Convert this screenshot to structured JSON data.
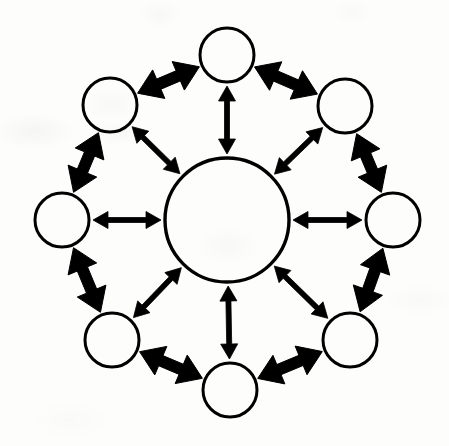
{
  "figure": {
    "kind": "network-diagram",
    "background_color": "#fdfdfc",
    "ink_color": "#000000",
    "canvas": {
      "width": 449,
      "height": 446
    }
  },
  "hub": {
    "label": "",
    "cx": 227,
    "cy": 220,
    "r": 62,
    "stroke_width": 3.4
  },
  "node_defaults": {
    "r": 27,
    "stroke_width": 3.0
  },
  "nodes": [
    {
      "id": "node-n",
      "name": "top-node",
      "label": "",
      "cx": 227,
      "cy": 55,
      "r": 27
    },
    {
      "id": "node-ne",
      "name": "upper-right-node",
      "label": "",
      "cx": 345,
      "cy": 106,
      "r": 27
    },
    {
      "id": "node-e",
      "name": "right-node",
      "label": "",
      "cx": 393,
      "cy": 220,
      "r": 27
    },
    {
      "id": "node-se",
      "name": "lower-right-node",
      "label": "",
      "cx": 350,
      "cy": 340,
      "r": 27
    },
    {
      "id": "node-s",
      "name": "bottom-node",
      "label": "",
      "cx": 230,
      "cy": 390,
      "r": 27
    },
    {
      "id": "node-sw",
      "name": "lower-left-node",
      "label": "",
      "cx": 112,
      "cy": 340,
      "r": 27
    },
    {
      "id": "node-w",
      "name": "left-node",
      "label": "",
      "cx": 62,
      "cy": 220,
      "r": 27
    },
    {
      "id": "node-nw",
      "name": "upper-left-node",
      "label": "",
      "cx": 110,
      "cy": 105,
      "r": 27
    }
  ],
  "spokes": {
    "style": "double-headed-arrow",
    "shaft_width": 5,
    "head_length": 15,
    "head_width": 17,
    "gap_hub": 4,
    "gap_node": 4,
    "edges": [
      {
        "id": "spoke-hub-n",
        "name": "spoke-hub-to-top-node",
        "from": "hub",
        "to": "node-n"
      },
      {
        "id": "spoke-hub-ne",
        "name": "spoke-hub-to-upper-right-node",
        "from": "hub",
        "to": "node-ne"
      },
      {
        "id": "spoke-hub-e",
        "name": "spoke-hub-to-right-node",
        "from": "hub",
        "to": "node-e"
      },
      {
        "id": "spoke-hub-se",
        "name": "spoke-hub-to-lower-right-node",
        "from": "hub",
        "to": "node-se"
      },
      {
        "id": "spoke-hub-s",
        "name": "spoke-hub-to-bottom-node",
        "from": "hub",
        "to": "node-s"
      },
      {
        "id": "spoke-hub-sw",
        "name": "spoke-hub-to-lower-left-node",
        "from": "hub",
        "to": "node-sw"
      },
      {
        "id": "spoke-hub-w",
        "name": "spoke-hub-to-left-node",
        "from": "hub",
        "to": "node-w"
      },
      {
        "id": "spoke-hub-nw",
        "name": "spoke-hub-to-upper-left-node",
        "from": "hub",
        "to": "node-nw"
      }
    ]
  },
  "ring": {
    "style": "double-headed-arrow",
    "shaft_width": 11,
    "head_length": 23,
    "head_width": 31,
    "gap_node": 3,
    "edges": [
      {
        "id": "ring-nw-n",
        "name": "ring-upper-left-to-top",
        "from": "node-nw",
        "to": "node-n"
      },
      {
        "id": "ring-n-ne",
        "name": "ring-top-to-upper-right",
        "from": "node-n",
        "to": "node-ne"
      },
      {
        "id": "ring-ne-e",
        "name": "ring-upper-right-to-right",
        "from": "node-ne",
        "to": "node-e"
      },
      {
        "id": "ring-e-se",
        "name": "ring-right-to-lower-right",
        "from": "node-e",
        "to": "node-se"
      },
      {
        "id": "ring-se-s",
        "name": "ring-lower-right-to-bottom",
        "from": "node-se",
        "to": "node-s"
      },
      {
        "id": "ring-s-sw",
        "name": "ring-bottom-to-lower-left",
        "from": "node-s",
        "to": "node-sw"
      },
      {
        "id": "ring-sw-w",
        "name": "ring-lower-left-to-left",
        "from": "node-sw",
        "to": "node-w"
      },
      {
        "id": "ring-w-nw",
        "name": "ring-left-to-upper-left",
        "from": "node-w",
        "to": "node-nw"
      }
    ]
  }
}
